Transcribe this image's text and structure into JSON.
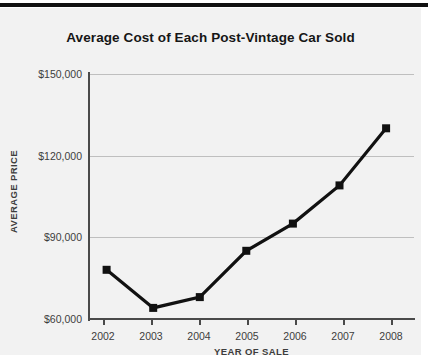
{
  "chart_data": {
    "type": "line",
    "title": "Average Cost of Each Post-Vintage Car Sold",
    "xlabel": "YEAR OF SALE",
    "ylabel": "AVERAGE PRICE",
    "categories": [
      "2002",
      "2003",
      "2004",
      "2005",
      "2006",
      "2007",
      "2008"
    ],
    "x": [
      2002,
      2003,
      2004,
      2005,
      2006,
      2007,
      2008
    ],
    "values": [
      81000,
      67000,
      71000,
      88000,
      98000,
      112000,
      133000
    ],
    "series": [
      {
        "name": "Average price",
        "values": [
          81000,
          67000,
          71000,
          88000,
          98000,
          112000,
          133000
        ]
      }
    ],
    "ylim": [
      60000,
      150000
    ],
    "yticks": [
      60000,
      90000,
      120000,
      150000
    ],
    "ytick_labels": [
      "$60,000",
      "$90,000",
      "$120,000",
      "$150,000"
    ],
    "xlim": [
      2001.6,
      2008.6
    ],
    "grid": "horizontal",
    "legend": "none",
    "marker": "square",
    "line_color": "#111111",
    "marker_color": "#111111",
    "grid_color": "#bfbfbf",
    "axis_color": "#4a4a4a",
    "background_color": "#f2f2f2"
  },
  "axes": {
    "y_labels": [
      {
        "text": "$150,000",
        "value": 150000
      },
      {
        "text": "$120,000",
        "value": 120000
      },
      {
        "text": "$90,000",
        "value": 90000
      },
      {
        "text": "$60,000",
        "value": 60000
      }
    ],
    "x_labels": [
      {
        "text": "2002"
      },
      {
        "text": "2003"
      },
      {
        "text": "2004"
      },
      {
        "text": "2005"
      },
      {
        "text": "2006"
      },
      {
        "text": "2007"
      },
      {
        "text": "2008"
      }
    ]
  }
}
